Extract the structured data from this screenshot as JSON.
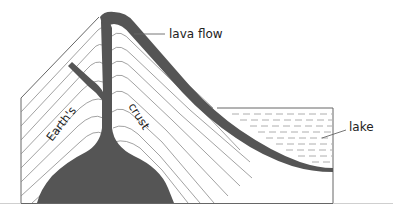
{
  "diagram": {
    "labels": {
      "lava_flow": "lava flow",
      "lake": "lake",
      "earths": "Earth's",
      "crust": "crust"
    },
    "colors": {
      "magma": "#555555",
      "outline": "#666666",
      "strata": "#8a8a8a",
      "water_dash": "#9a9a9a",
      "text": "#222222"
    }
  }
}
